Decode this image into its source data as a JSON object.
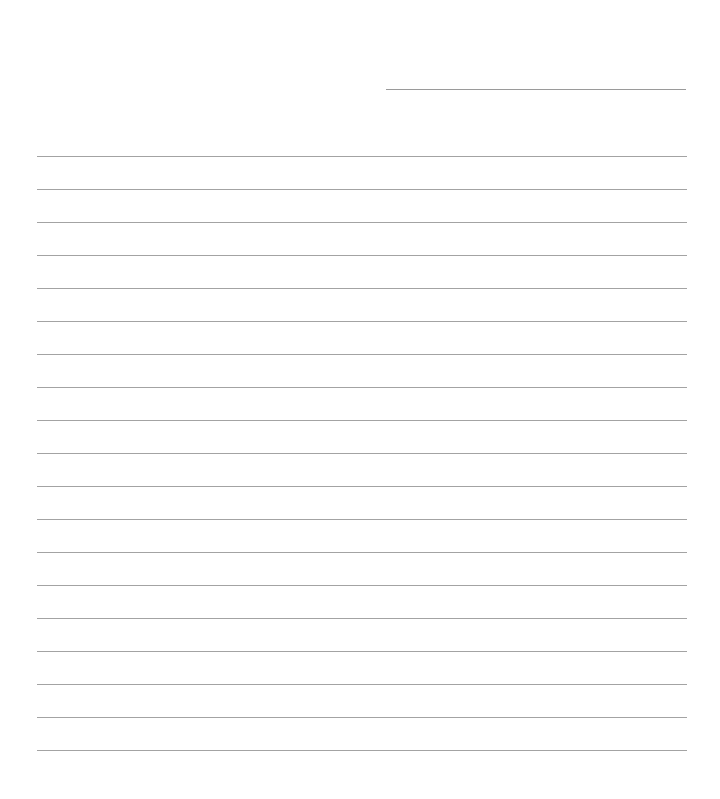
{
  "document": {
    "type": "lined-paper",
    "background_color": "#ffffff",
    "line_color": "#a3a3a3",
    "name_line": {
      "x1": 386,
      "x2": 686,
      "y": 89
    },
    "ruled_lines": {
      "count": 19,
      "x1": 37,
      "x2": 687,
      "first_y": 156,
      "spacing": 33
    }
  }
}
